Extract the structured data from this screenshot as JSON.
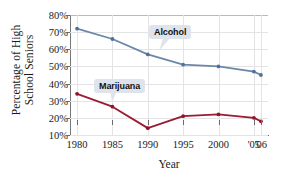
{
  "chart_data": {
    "type": "line",
    "title": "",
    "xlabel": "Year",
    "ylabel_line1": "Percentage of High",
    "ylabel_line2": "School Seniors",
    "categories": [
      "1980",
      "1985",
      "1990",
      "1995",
      "2000",
      "'05",
      "'06"
    ],
    "x": [
      1980,
      1985,
      1990,
      1995,
      2000,
      2005,
      2006
    ],
    "xlim": [
      1979,
      2007
    ],
    "ylim": [
      8,
      82
    ],
    "ytick_labels": [
      "80%",
      "70%",
      "60%",
      "50%",
      "40%",
      "30%",
      "20%",
      "10%"
    ],
    "ytick_values": [
      80,
      70,
      60,
      50,
      40,
      30,
      20,
      10
    ],
    "grid": true,
    "legend": "annotated-callouts",
    "series": [
      {
        "name": "Alcohol",
        "color": "#6b87a8",
        "marker_color": "#52719a",
        "values": [
          72,
          66,
          57,
          51,
          50,
          47,
          45
        ]
      },
      {
        "name": "Marijuana",
        "color": "#9b1b33",
        "marker_color": "#8d1630",
        "values": [
          34,
          26.5,
          14,
          21,
          22,
          20,
          18
        ]
      }
    ],
    "annotations": [
      {
        "text": "Alcohol",
        "series": "Alcohol"
      },
      {
        "text": "Marijuana",
        "series": "Marijuana"
      }
    ]
  },
  "colors": {
    "alcohol": "#6b87a8",
    "marijuana": "#9b1b33",
    "callout_bg": "#dfe4ec",
    "grid": "#e4e4e6",
    "axis": "#6a6a6a",
    "text": "#1a1a1a",
    "background": "#ffffff"
  }
}
